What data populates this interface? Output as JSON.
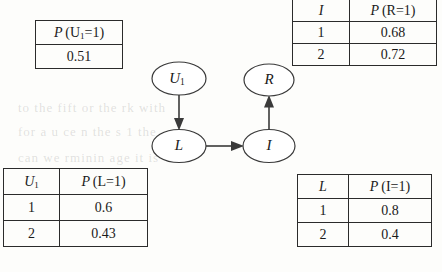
{
  "figure": {
    "type": "bayesian-network-with-cpts",
    "nodes": [
      {
        "id": "U1",
        "label": "U",
        "sub": "1",
        "cx": 179,
        "cy": 78.5,
        "rx": 27,
        "ry": 16.5
      },
      {
        "id": "R",
        "label": "R",
        "sub": "",
        "cx": 269,
        "cy": 80,
        "rx": 25,
        "ry": 16
      },
      {
        "id": "L",
        "label": "L",
        "sub": "",
        "cx": 179,
        "cy": 146,
        "rx": 27,
        "ry": 16.5
      },
      {
        "id": "I",
        "label": "I",
        "sub": "",
        "cx": 269,
        "cy": 146,
        "rx": 26,
        "ry": 16.5
      }
    ],
    "edges": [
      {
        "from": "U1",
        "to": "L",
        "direction": "down"
      },
      {
        "from": "L",
        "to": "I",
        "direction": "right"
      },
      {
        "from": "I",
        "to": "R",
        "direction": "up"
      }
    ]
  },
  "tables": {
    "prior_u1": {
      "name": "P(U1=1)",
      "header": "P (U₁=1)",
      "header_p": "P",
      "header_rest": "(U",
      "header_sub": "1",
      "header_tail": "=1)",
      "value": "0.51"
    },
    "cpt_r": {
      "name": "P(R=1 | I)",
      "col_parent": "I",
      "col_prob_p": "P",
      "col_prob_rest": "(R=1)",
      "rows": [
        {
          "parent": "1",
          "prob": "0.68"
        },
        {
          "parent": "2",
          "prob": "0.72"
        }
      ]
    },
    "cpt_l": {
      "name": "P(L=1 | U1)",
      "col_parent": "U",
      "col_parent_sub": "1",
      "col_prob_p": "P",
      "col_prob_rest": "(L=1)",
      "rows": [
        {
          "parent": "1",
          "prob": "0.6"
        },
        {
          "parent": "2",
          "prob": "0.43"
        }
      ]
    },
    "cpt_i": {
      "name": "P(I=1 | L)",
      "col_parent": "L",
      "col_prob_p": "P",
      "col_prob_rest": "(I=1)",
      "rows": [
        {
          "parent": "1",
          "prob": "0.8"
        },
        {
          "parent": "2",
          "prob": "0.4"
        }
      ]
    }
  },
  "background_bleed": {
    "line1": "to the fift  or the  rk with",
    "line2": "for a  u  ce  n the  s  1  the",
    "line3": "can  we  rminin  age  it is"
  },
  "colors": {
    "page": "#fdfdfb",
    "ink": "#1a1a1a",
    "rule": "#2b2b2b",
    "node_stroke": "#3a3a3a"
  }
}
